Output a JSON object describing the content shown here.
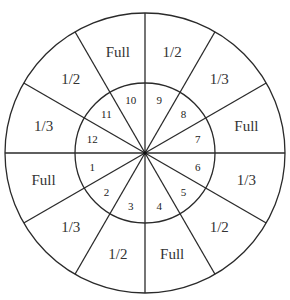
{
  "diagram": {
    "type": "concentric-sector-wheel",
    "center": [
      145,
      153
    ],
    "outer_radius": 140,
    "inner_radius": 70,
    "sectors": 12,
    "colors": {
      "line": "#2a2a2a",
      "text": "#333333",
      "background": "#ffffff"
    },
    "inner_labels": [
      "1",
      "2",
      "3",
      "4",
      "5",
      "6",
      "7",
      "8",
      "9",
      "10",
      "11",
      "12"
    ],
    "outer_labels": [
      "Full",
      "1/3",
      "1/2",
      "Full",
      "1/2",
      "1/3",
      "Full",
      "1/3",
      "1/2",
      "Full",
      "1/2",
      "1/3"
    ]
  }
}
